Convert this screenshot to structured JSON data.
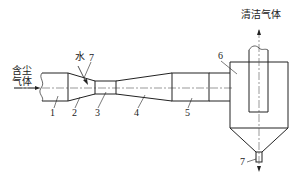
{
  "labels": {
    "inlet": [
      "含尘",
      "气体"
    ],
    "water": "水",
    "outlet": "清洁气体"
  },
  "parts": [
    {
      "id": "1",
      "label": "1"
    },
    {
      "id": "2",
      "label": "2"
    },
    {
      "id": "3",
      "label": "3"
    },
    {
      "id": "4",
      "label": "4"
    },
    {
      "id": "5",
      "label": "5"
    },
    {
      "id": "6",
      "label": "6"
    },
    {
      "id": "7a",
      "label": "7"
    },
    {
      "id": "7b",
      "label": "7"
    }
  ],
  "colors": {
    "line": "#222222",
    "centerline": "#555555",
    "background": "#ffffff"
  }
}
